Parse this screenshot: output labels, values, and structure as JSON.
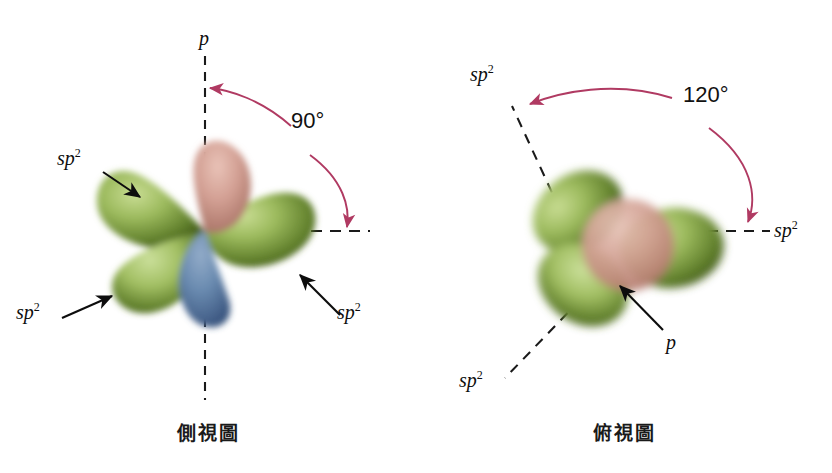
{
  "figure": {
    "background": "#ffffff",
    "colors": {
      "sp2_lobe_green_light": "#9dbb5e",
      "sp2_lobe_green_dark": "#46601f",
      "p_lobe_top_pink": "#cf9a90",
      "p_lobe_bottom_blue": "#5f7fa8",
      "p_sphere_pink": "#cfa096",
      "angle_arc_red": "#b03a62",
      "dash_black": "#1a1a1a",
      "arrow_black": "#0d0d0d",
      "text_black": "#111111"
    }
  },
  "panels": [
    {
      "id": "side-view",
      "caption": "側視圖",
      "angle": {
        "value": "90°",
        "from_axis": "p (vertical)",
        "to_axis": "sp2 (horizontal right)"
      },
      "axes": [
        {
          "name": "p-axis",
          "style": "dashed",
          "orientation": "vertical-up"
        },
        {
          "name": "p-axis-lower",
          "style": "dashed",
          "orientation": "vertical-down"
        },
        {
          "name": "sp2-axis",
          "style": "dashed",
          "orientation": "horizontal-right"
        }
      ],
      "labels": [
        {
          "id": "p-top",
          "text": "p",
          "sup": ""
        },
        {
          "id": "sp2-upper-left",
          "text": "sp",
          "sup": "2"
        },
        {
          "id": "sp2-lower-left",
          "text": "sp",
          "sup": "2"
        },
        {
          "id": "sp2-lower-right",
          "text": "sp",
          "sup": "2"
        }
      ],
      "orbitals": {
        "sp2_count": 3,
        "p_lobes": 2,
        "description": "three green sp2 lobes plus pink upper and blue lower p lobes"
      }
    },
    {
      "id": "top-view",
      "caption": "俯視圖",
      "angle": {
        "value": "120°",
        "from_axis": "sp2 (upper left)",
        "to_axis": "sp2 (right)"
      },
      "axes": [
        {
          "name": "sp2-axis-upper-left",
          "style": "dashed",
          "orientation": "diagonal-up-left"
        },
        {
          "name": "sp2-axis-right",
          "style": "dashed",
          "orientation": "horizontal-right"
        },
        {
          "name": "sp2-axis-lower-left",
          "style": "dashed",
          "orientation": "diagonal-down-left"
        }
      ],
      "labels": [
        {
          "id": "sp2-upper-left",
          "text": "sp",
          "sup": "2"
        },
        {
          "id": "sp2-right",
          "text": "sp",
          "sup": "2"
        },
        {
          "id": "sp2-lower-left",
          "text": "sp",
          "sup": "2"
        },
        {
          "id": "p-center",
          "text": "p",
          "sup": ""
        }
      ],
      "orbitals": {
        "sp2_count": 3,
        "p_lobes": 1,
        "description": "three green sp2 lobes at 120 degrees around a central pink p sphere seen end-on"
      }
    }
  ]
}
